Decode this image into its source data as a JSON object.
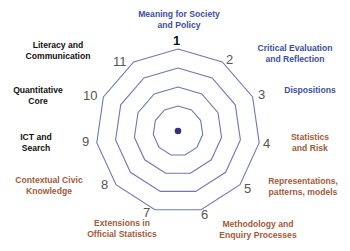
{
  "diagram": {
    "type": "radar-web",
    "axis_count": 11,
    "rings": 4,
    "colors": {
      "blue_label": "#3b4fa0",
      "black_label": "#111111",
      "brown_label": "#a35a3a",
      "ring_stroke": "#6f78b0",
      "center_dot": "#3a2f7a",
      "number": "#555555"
    },
    "axes": [
      {
        "n": "1",
        "label_line1": "Meaning for Society",
        "label_line2": "and Policy",
        "color": "blue"
      },
      {
        "n": "2",
        "label_line1": "Critical Evaluation",
        "label_line2": "and Reflection",
        "color": "blue"
      },
      {
        "n": "3",
        "label_line1": "Dispositions",
        "label_line2": "",
        "color": "blue"
      },
      {
        "n": "4",
        "label_line1": "Statistics",
        "label_line2": "and Risk",
        "color": "brown"
      },
      {
        "n": "5",
        "label_line1": "Representations,",
        "label_line2": "patterns, models",
        "color": "brown"
      },
      {
        "n": "6",
        "label_line1": "Methodology and",
        "label_line2": "Enquiry Processes",
        "color": "brown"
      },
      {
        "n": "7",
        "label_line1": "Extensions in",
        "label_line2": "Official Statistics",
        "color": "brown"
      },
      {
        "n": "8",
        "label_line1": "Contextual  Civic",
        "label_line2": "Knowledge",
        "color": "brown"
      },
      {
        "n": "9",
        "label_line1": "ICT and",
        "label_line2": "Search",
        "color": "black"
      },
      {
        "n": "10",
        "label_line1": "Quantitative",
        "label_line2": "Core",
        "color": "black"
      },
      {
        "n": "11",
        "label_line1": "Literacy and",
        "label_line2": "Communication",
        "color": "black"
      }
    ]
  }
}
